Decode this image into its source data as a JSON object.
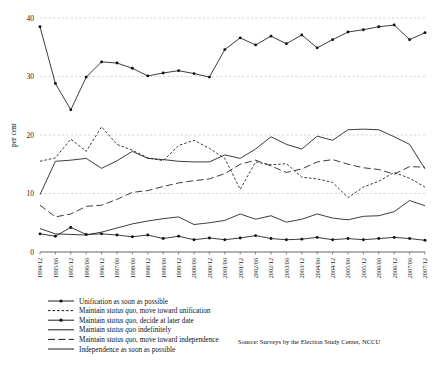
{
  "chart_data": {
    "type": "line",
    "title": "",
    "xlabel": "",
    "ylabel": "per cent",
    "ylim": [
      0,
      40
    ],
    "yticks": [
      0,
      10,
      20,
      30,
      40
    ],
    "grid": true,
    "legend_position": "bottom-left",
    "source": "Source: Surveys by the Election Study Center, NCCU",
    "categories": [
      "1994/12",
      "1995/06",
      "1995/12",
      "1996/06",
      "1996/12",
      "1997/06",
      "1998/06",
      "1998/12",
      "1999/06",
      "1999/12",
      "2000/06",
      "2000/12",
      "2001/06",
      "2001/12",
      "2002/06",
      "2002/12",
      "2003/06",
      "2003/12",
      "2004/06",
      "2004/12",
      "2005/06",
      "2005/12",
      "2006/06",
      "2006/12",
      "2007/06",
      "2007/12"
    ],
    "series": [
      {
        "name": "Unification as soon as possible",
        "style": "solid-marker",
        "values": [
          3.1,
          2.7,
          4.2,
          3.0,
          3.1,
          2.9,
          2.6,
          2.9,
          2.3,
          2.7,
          2.1,
          2.4,
          2.1,
          2.4,
          2.8,
          2.3,
          2.1,
          2.2,
          2.5,
          2.1,
          2.3,
          2.1,
          2.3,
          2.5,
          2.3,
          2.0
        ]
      },
      {
        "name": "Maintain status quo, move toward unification",
        "style": "fine-dashed",
        "values": [
          15.5,
          16.1,
          19.3,
          17.2,
          21.4,
          18.4,
          17.4,
          16.1,
          15.6,
          18.2,
          19.1,
          17.7,
          16.0,
          10.7,
          15.4,
          14.9,
          15.1,
          12.8,
          12.5,
          11.9,
          9.3,
          11.1,
          12.1,
          13.6,
          12.6,
          11.1
        ]
      },
      {
        "name": "Maintain status quo, decide at later date",
        "style": "solid-marker",
        "values": [
          38.5,
          28.8,
          24.3,
          29.9,
          32.5,
          32.3,
          31.4,
          30.1,
          30.6,
          31.0,
          30.5,
          29.9,
          34.6,
          36.6,
          35.4,
          36.9,
          35.6,
          37.1,
          34.9,
          36.3,
          37.6,
          38.0,
          38.5,
          38.8,
          36.3,
          37.5
        ]
      },
      {
        "name": "Maintain status quo indefinitely",
        "style": "solid",
        "values": [
          9.8,
          15.5,
          15.7,
          16.0,
          14.3,
          15.6,
          17.2,
          16.0,
          15.8,
          15.5,
          15.4,
          15.4,
          16.6,
          16.0,
          17.6,
          19.7,
          18.4,
          17.6,
          19.8,
          19.1,
          20.9,
          21.0,
          20.9,
          19.7,
          18.4,
          14.2
        ]
      },
      {
        "name": "Maintain status quo, move toward independence",
        "style": "long-dashed",
        "values": [
          8.0,
          6.0,
          6.5,
          7.8,
          8.0,
          9.0,
          10.2,
          10.5,
          11.2,
          11.8,
          12.2,
          12.5,
          13.4,
          15.0,
          15.7,
          14.7,
          13.6,
          14.2,
          15.4,
          15.8,
          15.0,
          14.4,
          14.1,
          13.3,
          14.6,
          14.5
        ]
      },
      {
        "name": "Independence as soon as possible",
        "style": "solid",
        "values": [
          4.0,
          3.1,
          3.0,
          2.9,
          3.4,
          4.1,
          4.8,
          5.3,
          5.7,
          6.0,
          4.7,
          5.0,
          5.4,
          6.5,
          5.6,
          6.2,
          5.1,
          5.6,
          6.5,
          5.8,
          5.5,
          6.1,
          6.2,
          6.9,
          8.8,
          7.9
        ]
      }
    ]
  }
}
